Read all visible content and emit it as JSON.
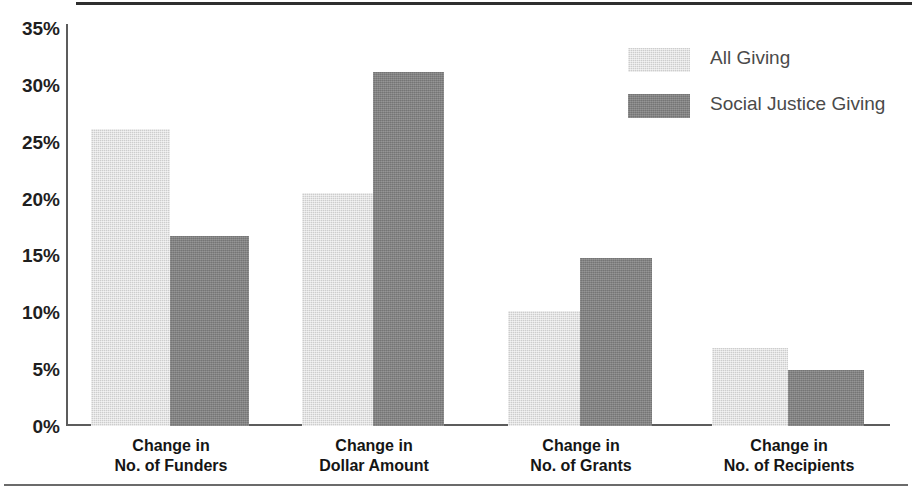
{
  "chart_data": {
    "type": "bar",
    "title": "",
    "subtitle": "",
    "xlabel": "",
    "ylabel": "",
    "ylim": [
      0,
      35
    ],
    "yunit": "%",
    "grid": false,
    "legend_position": "top-right",
    "categories": [
      "Change in No. of Funders",
      "Change in Dollar Amount",
      "Change in No. of Grants",
      "Change in No. of Recipients"
    ],
    "category_lines": [
      [
        "Change in",
        "No. of Funders"
      ],
      [
        "Change in",
        "Dollar Amount"
      ],
      [
        "Change in",
        "No. of Grants"
      ],
      [
        "Change in",
        "No. of Recipients"
      ]
    ],
    "yticks": [
      "0%",
      "5%",
      "10%",
      "15%",
      "20%",
      "25%",
      "30%",
      "35%"
    ],
    "ytick_values": [
      0,
      5,
      10,
      15,
      20,
      25,
      30,
      35
    ],
    "series": [
      {
        "name": "All Giving",
        "color": "#cdcdcd",
        "values": [
          26.0,
          20.4,
          10.1,
          6.8
        ]
      },
      {
        "name": "Social Justice Giving",
        "color": "#808080",
        "values": [
          16.6,
          31.0,
          14.7,
          4.9
        ]
      }
    ]
  },
  "legend": {
    "items": [
      {
        "label": "All Giving",
        "swatch": "light"
      },
      {
        "label": "Social Justice Giving",
        "swatch": "dark"
      }
    ]
  },
  "colors": {
    "light_bar": "#cdcdcd",
    "dark_bar": "#808080",
    "axis": "#5c5c5c",
    "top_rule": "#2e2e2e",
    "bottom_rule": "#6b6b6b",
    "tick_text": "#1f1f1f",
    "legend_text": "#4a4a4a"
  }
}
